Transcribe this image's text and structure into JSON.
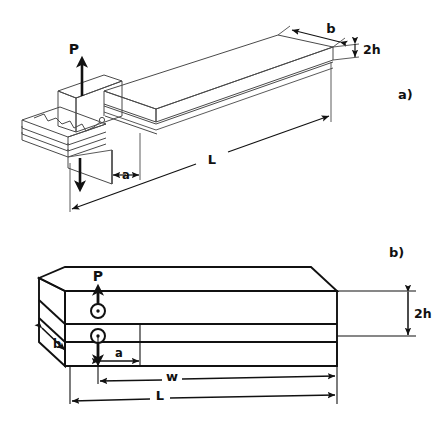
{
  "figure": {
    "background_color": "#ffffff",
    "line_color_a": "#4a4a4a",
    "line_color_b": "#111111",
    "text_color": "#111111",
    "panels": [
      {
        "id": "a",
        "label": "a)",
        "description": "Perspective view of split double-cantilever beam with opening load P",
        "dimensions": [
          {
            "name": "b",
            "label": "b",
            "meaning": "beam width"
          },
          {
            "name": "2h",
            "label": "2h",
            "meaning": "total beam height"
          },
          {
            "name": "a",
            "label": "a",
            "meaning": "crack length"
          },
          {
            "name": "L",
            "label": "L",
            "meaning": "total beam length"
          }
        ],
        "loads": [
          {
            "name": "P-up",
            "label": "P",
            "direction": "up"
          },
          {
            "name": "P-down",
            "label": "",
            "direction": "down"
          }
        ]
      },
      {
        "id": "b",
        "label": "b)",
        "description": "Side/perspective view of layered beam with pin loading points",
        "dimensions": [
          {
            "name": "b",
            "label": "b",
            "meaning": "beam width"
          },
          {
            "name": "2h",
            "label": "2h",
            "meaning": "total beam height"
          },
          {
            "name": "a",
            "label": "a",
            "meaning": "crack length"
          },
          {
            "name": "w",
            "label": "w",
            "meaning": "working span"
          },
          {
            "name": "L",
            "label": "L",
            "meaning": "total beam length"
          }
        ],
        "loads": [
          {
            "name": "P-up",
            "label": "P",
            "direction": "up"
          },
          {
            "name": "P-down",
            "label": "",
            "direction": "down"
          }
        ],
        "pins": [
          {
            "name": "upper-pin"
          },
          {
            "name": "lower-pin"
          }
        ]
      }
    ]
  }
}
